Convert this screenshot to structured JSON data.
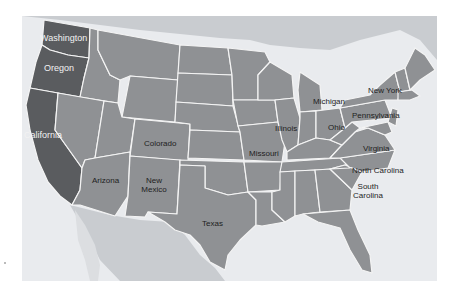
{
  "map": {
    "title": "United States map",
    "colors": {
      "background": "#e9ebee",
      "water": "#e9ebee",
      "neighbors": "#c9ccd0",
      "states": "#8f9194",
      "west_coast": "#5a5c5f",
      "borders": "#f4f4f4"
    },
    "labels": [
      {
        "name": "washington",
        "text": "Washington"
      },
      {
        "name": "oregon",
        "text": "Oregon"
      },
      {
        "name": "california",
        "text": "California"
      },
      {
        "name": "arizona",
        "text": "Arizona"
      },
      {
        "name": "new-mexico",
        "text": "New Mexico"
      },
      {
        "name": "colorado",
        "text": "Colorado"
      },
      {
        "name": "texas",
        "text": "Texas"
      },
      {
        "name": "illinois",
        "text": "Illinois"
      },
      {
        "name": "missouri",
        "text": "Missouri"
      },
      {
        "name": "michigan",
        "text": "Michigan"
      },
      {
        "name": "ohio",
        "text": "Ohio"
      },
      {
        "name": "new-york",
        "text": "New York"
      },
      {
        "name": "pennsylvania",
        "text": "Pennsylvania"
      },
      {
        "name": "virginia",
        "text": "Virginia"
      },
      {
        "name": "north-carolina",
        "text": "North Carolina"
      },
      {
        "name": "south-carolina",
        "text": "South Carolina"
      }
    ]
  }
}
